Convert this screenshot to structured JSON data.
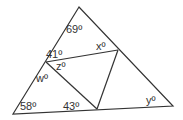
{
  "diagram": {
    "type": "geometry-triangle",
    "stroke_color": "#333333",
    "vertices": {
      "apex": [
        79,
        7
      ],
      "bottom_left": [
        13,
        114
      ],
      "bottom_right": [
        173,
        106
      ],
      "left_point": [
        46,
        62
      ],
      "right_point": [
        118,
        50
      ],
      "bottom_point": [
        97,
        109
      ]
    },
    "labels": [
      {
        "id": "angle-69",
        "text": "69º",
        "x": 66,
        "y": 33
      },
      {
        "id": "angle-41",
        "text": "41º",
        "x": 46,
        "y": 58
      },
      {
        "id": "angle-x",
        "text": "xº",
        "x": 96,
        "y": 50
      },
      {
        "id": "angle-z",
        "text": "zº",
        "x": 56,
        "y": 70
      },
      {
        "id": "angle-w",
        "text": "wº",
        "x": 36,
        "y": 82
      },
      {
        "id": "angle-58",
        "text": "58º",
        "x": 20,
        "y": 110
      },
      {
        "id": "angle-43",
        "text": "43º",
        "x": 63,
        "y": 110
      },
      {
        "id": "angle-y",
        "text": "yº",
        "x": 146,
        "y": 104
      }
    ]
  }
}
